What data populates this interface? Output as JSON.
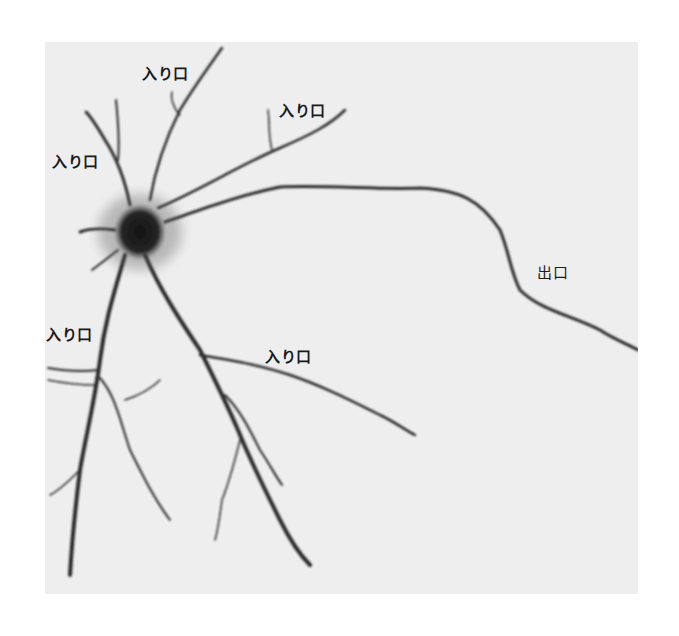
{
  "figure": {
    "background_color": "#eeeeee",
    "cell_color": "#1e1e1e",
    "labels": [
      {
        "id": "input-top",
        "text": "入り口",
        "x": 142,
        "y": 62
      },
      {
        "id": "input-upper-right",
        "text": "入り口",
        "x": 279,
        "y": 99
      },
      {
        "id": "input-left",
        "text": "入り口",
        "x": 52,
        "y": 150
      },
      {
        "id": "input-lower-left",
        "text": "入り口",
        "x": 46,
        "y": 323
      },
      {
        "id": "input-lower-right",
        "text": "入り口",
        "x": 265,
        "y": 345
      },
      {
        "id": "output",
        "text": "出口",
        "x": 537,
        "y": 261
      }
    ]
  }
}
